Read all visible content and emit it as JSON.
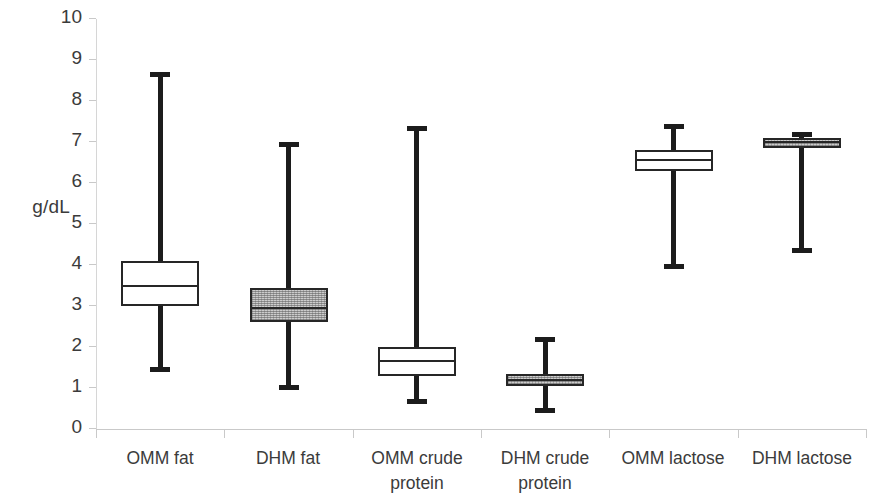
{
  "chart_data": {
    "type": "box",
    "title": "",
    "xlabel": "",
    "ylabel": "g/dL",
    "ylim": [
      0,
      10
    ],
    "y_ticks": [
      "0",
      "1",
      "2",
      "3",
      "4",
      "5",
      "6",
      "7",
      "8",
      "9",
      "10"
    ],
    "grid": false,
    "legend": "none",
    "categories": [
      "OMM fat",
      "DHM fat",
      "OMM crude protein",
      "DHM crude protein",
      "OMM lactose",
      "DHM lactose"
    ],
    "boxes": [
      {
        "label": "OMM fat",
        "whisker_low": 1.4,
        "q1": 3.0,
        "median": 3.5,
        "q3": 4.1,
        "whisker_high": 8.7,
        "fill": "white"
      },
      {
        "label": "DHM fat",
        "whisker_low": 0.95,
        "q1": 2.6,
        "median": 2.95,
        "q3": 3.45,
        "whisker_high": 7.0,
        "fill": "gray"
      },
      {
        "label": "OMM crude protein",
        "whisker_low": 0.6,
        "q1": 1.3,
        "median": 1.65,
        "q3": 2.0,
        "whisker_high": 7.4,
        "fill": "white"
      },
      {
        "label": "DHM crude protein",
        "whisker_low": 0.4,
        "q1": 1.05,
        "median": 1.2,
        "q3": 1.35,
        "whisker_high": 2.25,
        "fill": "gray"
      },
      {
        "label": "OMM lactose",
        "whisker_low": 3.9,
        "q1": 6.3,
        "median": 6.55,
        "q3": 6.8,
        "whisker_high": 7.45,
        "fill": "white"
      },
      {
        "label": "DHM lactose",
        "whisker_low": 4.3,
        "q1": 6.85,
        "median": 7.0,
        "q3": 7.1,
        "whisker_high": 7.25,
        "fill": "gray"
      }
    ]
  },
  "axis": {
    "y_title": "g/dL"
  },
  "colors": {
    "box_stroke": "#262626",
    "whisker": "#1c1c1c",
    "fill_gray": "#cccccc",
    "fill_white": "#ffffff",
    "axis": "#c9c9c9",
    "text": "#3b3b3b"
  },
  "labels": {
    "cat_0": "OMM fat",
    "cat_1": "DHM fat",
    "cat_2": "OMM crude protein",
    "cat_3": "DHM crude protein",
    "cat_4": "OMM lactose",
    "cat_5": "DHM lactose"
  }
}
